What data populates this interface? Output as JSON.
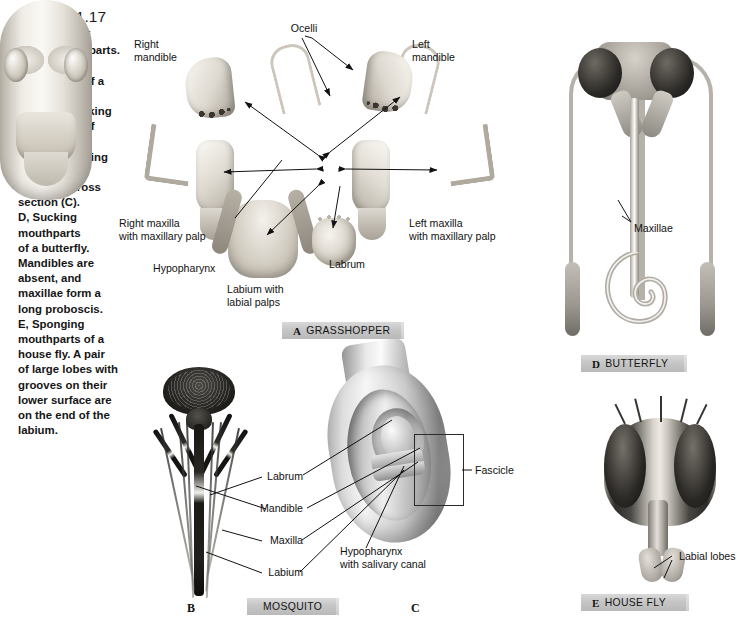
{
  "figure": {
    "number": "Figure 21.17",
    "caption_lines": [
      "Four types of",
      "insect mouthparts.",
      "A, Chewing",
      "mouthparts of a",
      "grasshopper.",
      "B and C, Sucking",
      "mouthparts of",
      "a mosquito.",
      "Parts of piercing",
      "fascicle are",
      "shown in cross",
      "section (C).",
      "D, Sucking",
      "mouthparts",
      "of a butterfly.",
      "Mandibles are",
      "absent, and",
      "maxillae form a",
      "long proboscis.",
      "E, Sponging",
      "mouthparts of a",
      "house fly. A pair",
      "of large lobes with",
      "grooves on their",
      "lower surface are",
      "on the end of the",
      "labium."
    ],
    "caption_full": "Four types of insect mouthparts. A, Chewing mouthparts of a grasshopper. B and C, Sucking mouthparts of a mosquito. Parts of piercing fascicle are shown in cross section (C). D, Sucking mouthparts of a butterfly. Mandibles are absent, and maxillae form a long proboscis. E, Sponging mouthparts of a house fly. A pair of large lobes with grooves on their lower surface are on the end of the labium."
  },
  "panels": [
    {
      "letter": "A",
      "name": "GRASSHOPPER"
    },
    {
      "letter": "B",
      "name": "MOSQUITO"
    },
    {
      "letter": "C",
      "name": ""
    },
    {
      "letter": "D",
      "name": "BUTTERFLY"
    },
    {
      "letter": "E",
      "name": "HOUSE FLY"
    }
  ],
  "banners": {
    "a": {
      "letter": "A",
      "text": "GRASSHOPPER"
    },
    "b": {
      "letter": "",
      "text": "MOSQUITO"
    },
    "d": {
      "letter": "D",
      "text": "BUTTERFLY"
    },
    "e": {
      "letter": "E",
      "text": "HOUSE FLY"
    }
  },
  "standalone_letters": {
    "b": "B",
    "c": "C"
  },
  "labels": {
    "grasshopper": {
      "ocelli": "Ocelli",
      "right_mandible": "Right\nmandible",
      "left_mandible": "Left\nmandible",
      "right_maxilla": "Right maxilla\nwith maxillary palp",
      "left_maxilla": "Left maxilla\nwith maxillary palp",
      "hypopharynx": "Hypopharynx",
      "labium": "Labium with\nlabial palps",
      "labrum": "Labrum"
    },
    "mosquito": {
      "labrum": "Labrum",
      "mandible": "Mandible",
      "maxilla": "Maxilla",
      "labium": "Labium",
      "hypopharynx": "Hypopharynx\nwith salivary canal",
      "fascicle": "Fascicle"
    },
    "butterfly": {
      "maxillae": "Maxillae"
    },
    "housefly": {
      "labial_lobes": "Labial lobes"
    }
  },
  "colors": {
    "background": "#ffffff",
    "banner": "#c6c6c6",
    "text": "#111111",
    "highlight_wash": "#a8a8a8"
  }
}
